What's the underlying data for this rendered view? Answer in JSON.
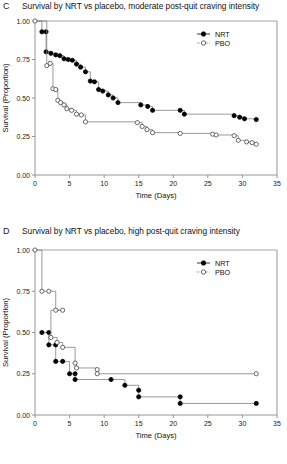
{
  "figure": {
    "background": "#ffffff",
    "nrt_color": "#000000",
    "pbo_color": "#ffffff",
    "line_color": "#808080",
    "axis_color": "#8a8a8a"
  },
  "panels": [
    {
      "letter": "C",
      "title": "Survival by NRT vs placebo, moderate post-quit craving intensity",
      "xlabel": "Time (Days)",
      "ylabel": "Survival (Proportion)",
      "legend": [
        {
          "label": "NRT",
          "marker": "filled-circle"
        },
        {
          "label": "PBO",
          "marker": "open-circle"
        }
      ],
      "chart_data": {
        "type": "line",
        "title": "Survival by NRT vs placebo, moderate post-quit craving intensity",
        "xlabel": "Time (Days)",
        "ylabel": "Survival (Proportion)",
        "xlim": [
          0,
          35
        ],
        "ylim": [
          0.0,
          1.0
        ],
        "xticks": [
          0,
          5,
          10,
          15,
          20,
          25,
          30,
          35
        ],
        "yticks": [
          0.0,
          0.25,
          0.5,
          0.75,
          1.0
        ],
        "ytick_labels": [
          "0.00",
          "0.25",
          "0.50",
          "0.75",
          "1.00"
        ],
        "xtick_labels": [
          "0",
          "5",
          "10",
          "15",
          "20",
          "25",
          "30",
          "35"
        ],
        "grid": false,
        "legend_position": "top-right",
        "series": [
          {
            "name": "NRT",
            "marker": "filled-circle",
            "x": [
              0,
              1,
              1.6,
              1.6,
              2.3,
              3.0,
              3.6,
              4.2,
              4.8,
              5.4,
              6.0,
              6.6,
              7.3,
              8.0,
              8.6,
              9.2,
              9.8,
              10.6,
              11.3,
              12.0,
              15.3,
              16.3,
              17.0,
              21.0,
              21.6,
              28.8,
              29.6,
              30.3,
              32.0
            ],
            "y": [
              1.0,
              0.93,
              0.93,
              0.8,
              0.79,
              0.78,
              0.775,
              0.755,
              0.75,
              0.745,
              0.72,
              0.7,
              0.67,
              0.61,
              0.605,
              0.555,
              0.545,
              0.52,
              0.5,
              0.47,
              0.455,
              0.445,
              0.42,
              0.42,
              0.395,
              0.385,
              0.375,
              0.365,
              0.36
            ]
          },
          {
            "name": "PBO",
            "marker": "open-circle",
            "x": [
              0,
              1.7,
              2.2,
              2.6,
              3.0,
              3.3,
              3.7,
              4.2,
              4.6,
              5.3,
              6.0,
              6.7,
              7.3,
              14.8,
              15.5,
              16.2,
              17.0,
              21.0,
              25.7,
              26.2,
              28.8,
              29.4,
              30.6,
              31.4,
              32.0
            ],
            "y": [
              1.0,
              0.71,
              0.725,
              0.56,
              0.555,
              0.485,
              0.47,
              0.455,
              0.43,
              0.42,
              0.395,
              0.39,
              0.345,
              0.34,
              0.315,
              0.295,
              0.275,
              0.27,
              0.265,
              0.26,
              0.255,
              0.225,
              0.215,
              0.21,
              0.2
            ]
          }
        ]
      }
    },
    {
      "letter": "D",
      "title": "Survival by NRT vs placebo, high post-quit craving intensity",
      "xlabel": "Time (Days)",
      "ylabel": "Survival (Proportion)",
      "legend": [
        {
          "label": "NRT",
          "marker": "filled-circle"
        },
        {
          "label": "PBO",
          "marker": "open-circle"
        }
      ],
      "chart_data": {
        "type": "line",
        "title": "Survival by NRT vs placebo, high post-quit craving intensity",
        "xlabel": "Time (Days)",
        "ylabel": "Survival (Proportion)",
        "xlim": [
          0,
          35
        ],
        "ylim": [
          0.0,
          1.0
        ],
        "xticks": [
          0,
          5,
          10,
          15,
          20,
          25,
          30,
          35
        ],
        "yticks": [
          0.0,
          0.25,
          0.5,
          0.75,
          1.0
        ],
        "ytick_labels": [
          "0.00",
          "0.25",
          "0.50",
          "0.75",
          "1.00"
        ],
        "xtick_labels": [
          "0",
          "5",
          "10",
          "15",
          "20",
          "25",
          "30",
          "35"
        ],
        "grid": false,
        "legend_position": "top-right",
        "series": [
          {
            "name": "NRT",
            "marker": "filled-circle",
            "x": [
              1.0,
              2.0,
              2.0,
              3.0,
              3.0,
              4.0,
              5.0,
              5.8,
              5.8,
              11.0,
              13.0,
              15.0,
              15.0,
              21.0,
              21.0,
              32.0
            ],
            "y": [
              0.5,
              0.5,
              0.425,
              0.425,
              0.325,
              0.325,
              0.25,
              0.25,
              0.215,
              0.215,
              0.18,
              0.15,
              0.11,
              0.11,
              0.07,
              0.07
            ]
          },
          {
            "name": "PBO",
            "marker": "open-circle",
            "x": [
              0,
              1.0,
              2.0,
              3.0,
              4.0,
              2.3,
              3.2,
              4.0,
              5.8,
              6.0,
              9.0,
              9.0,
              32.0
            ],
            "y": [
              1.0,
              0.75,
              0.75,
              0.635,
              0.635,
              0.47,
              0.44,
              0.41,
              0.315,
              0.285,
              0.275,
              0.25,
              0.25
            ]
          }
        ]
      }
    }
  ]
}
